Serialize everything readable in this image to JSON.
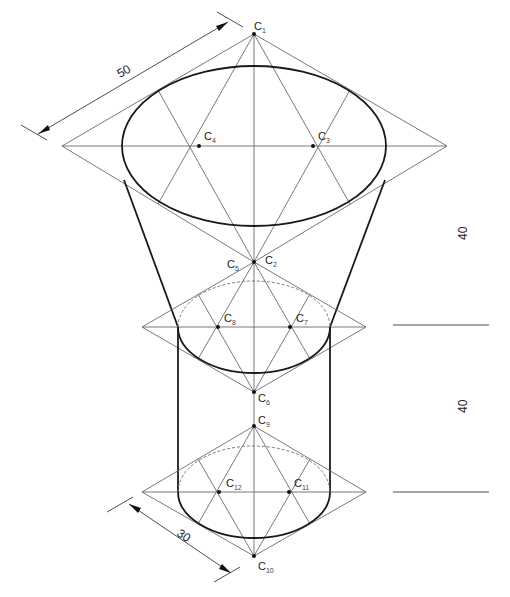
{
  "figure": {
    "type": "isometric construction drawing"
  },
  "labels": {
    "c1": {
      "letter": "C",
      "sub": "1"
    },
    "c2": {
      "letter": "C",
      "sub": "2"
    },
    "c3": {
      "letter": "C",
      "sub": "3"
    },
    "c4": {
      "letter": "C",
      "sub": "4"
    },
    "c5": {
      "letter": "C",
      "sub": "5"
    },
    "c6": {
      "letter": "C",
      "sub": "6"
    },
    "c7": {
      "letter": "C",
      "sub": "7"
    },
    "c8": {
      "letter": "C",
      "sub": "8"
    },
    "c9": {
      "letter": "C",
      "sub": "9"
    },
    "c10": {
      "letter": "C",
      "sub": "10"
    },
    "c11": {
      "letter": "C",
      "sub": "11"
    },
    "c12": {
      "letter": "C",
      "sub": "12"
    }
  },
  "dimensions": {
    "top_diameter": "50",
    "bottom_diameter": "30",
    "frustum_height": "40",
    "cylinder_height": "40"
  },
  "colors": {
    "construction_line": "#6a6a6a",
    "outline": "#1a1a1a",
    "text": "#222222"
  }
}
